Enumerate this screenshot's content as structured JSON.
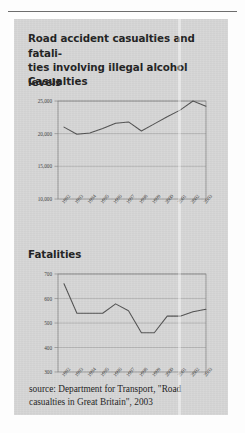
{
  "figure": {
    "title_line1": "Road accident casualties and fatali-",
    "title_line2": "ties involving illegal alcohol levels",
    "source_line1": "source: Department for Transport, \"Road",
    "source_line2": "casualties in Great Britain\", 2003",
    "source_full": "source: Department for Transport, \"Road casualties in Great Britain\", 2003",
    "panel_color": "#d5d5d5",
    "line_color": "#4f4f4f",
    "frame_color": "#7e7e7e"
  },
  "sections": {
    "casualties_label": "Casualties",
    "fatalities_label": "Fatalities"
  },
  "chart_data": [
    {
      "type": "line",
      "title": "Casualties",
      "xlabel": "",
      "ylabel": "",
      "grid": true,
      "legend": "none",
      "categories": [
        "1992",
        "1993",
        "1994",
        "1995",
        "1996",
        "1997",
        "1998",
        "1999",
        "2000",
        "2001",
        "2002",
        "2003"
      ],
      "values": [
        21000,
        19900,
        20100,
        20800,
        21600,
        21800,
        20400,
        21500,
        22600,
        23600,
        25000,
        24200
      ],
      "ylim": [
        10000,
        25000
      ],
      "yticks": [
        10000,
        15000,
        20000,
        25000
      ],
      "ytick_labels": [
        "10,000",
        "15,000",
        "20,000",
        "25,000"
      ],
      "xtick_labels": [
        "1992",
        "1993",
        "1994",
        "1995",
        "1996",
        "1997",
        "1998",
        "1999",
        "2000",
        "2001",
        "2002",
        "2003"
      ]
    },
    {
      "type": "line",
      "title": "Fatalities",
      "xlabel": "",
      "ylabel": "",
      "grid": true,
      "legend": "none",
      "categories": [
        "1992",
        "1993",
        "1994",
        "1995",
        "1996",
        "1997",
        "1998",
        "1999",
        "2000",
        "2001",
        "2002",
        "2003"
      ],
      "values": [
        660,
        540,
        540,
        540,
        578,
        550,
        460,
        460,
        528,
        528,
        546,
        556
      ],
      "ylim": [
        300,
        700
      ],
      "yticks": [
        300,
        400,
        500,
        600,
        700
      ],
      "ytick_labels": [
        "300",
        "400",
        "500",
        "600",
        "700"
      ],
      "xtick_labels": [
        "1992",
        "1993",
        "1994",
        "1995",
        "1996",
        "1997",
        "1998",
        "1999",
        "2000",
        "2001",
        "2002",
        "2003"
      ]
    }
  ]
}
